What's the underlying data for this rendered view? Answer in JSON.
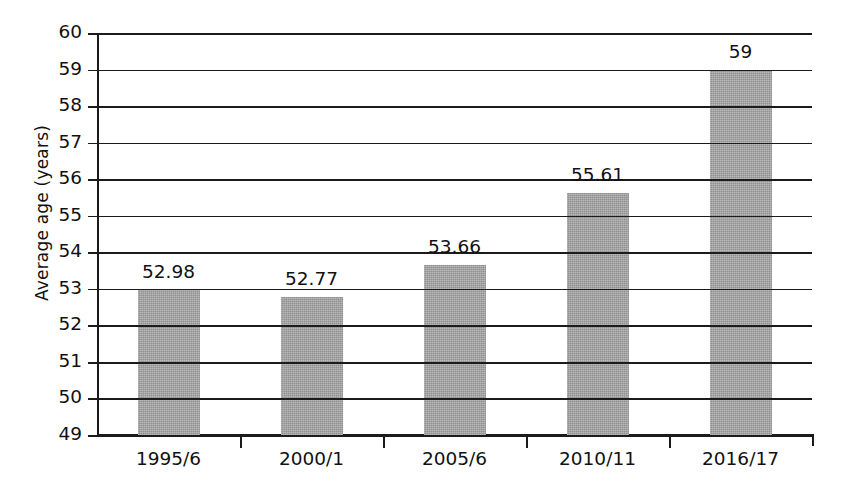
{
  "chart_data": {
    "type": "bar",
    "title": "",
    "subtitle": "",
    "xlabel": "",
    "ylabel": "Average age (years)",
    "categories": [
      "1995/6",
      "2000/1",
      "2005/6",
      "2010/11",
      "2016/17"
    ],
    "values": [
      52.98,
      52.77,
      53.66,
      55.61,
      59
    ],
    "value_labels": [
      "52.98",
      "52.77",
      "53.66",
      "55.61",
      "59"
    ],
    "ylim": [
      49,
      60
    ],
    "ytick_step": 1,
    "yticks": [
      60,
      59,
      58,
      57,
      56,
      55,
      54,
      53,
      52,
      51,
      50,
      49
    ],
    "ytick_labels": [
      "60",
      "59",
      "58",
      "57",
      "56",
      "55",
      "54",
      "53",
      "52",
      "51",
      "50",
      "49"
    ],
    "grid": true,
    "grid_axis": "y",
    "legend": false,
    "legend_position": "none",
    "bar_color": "#a6a6a6",
    "axis_color": "#1b1b1b",
    "grid_color": "#1b1b1b",
    "background_color": "#ffffff",
    "text_color": "#111111",
    "series": [
      {
        "name": "Average age (years)",
        "values": [
          52.98,
          52.77,
          53.66,
          55.61,
          59
        ]
      }
    ]
  }
}
